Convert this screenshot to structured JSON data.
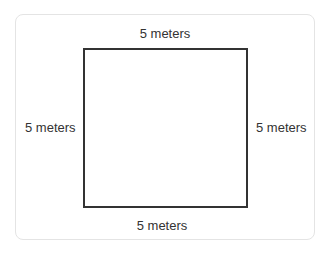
{
  "diagram": {
    "shape": "square",
    "colors": {
      "outline": "#333333",
      "text": "#333333",
      "card_border": "#e4e4e4",
      "background": "#ffffff"
    },
    "labels": {
      "top": "5 meters",
      "bottom": "5 meters",
      "left": "5 meters",
      "right": "5 meters"
    }
  }
}
